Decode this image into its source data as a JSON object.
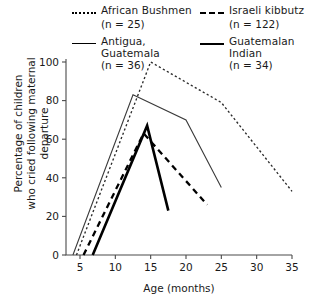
{
  "chart_data": {
    "type": "line",
    "title": "",
    "xlabel": "Age (months)",
    "ylabel": "Percentage of children\nwho cried following maternal departure",
    "xlim": [
      3,
      35
    ],
    "ylim": [
      0,
      100
    ],
    "xticks": [
      5,
      10,
      15,
      20,
      25,
      30,
      35
    ],
    "yticks": [
      0,
      20,
      40,
      60,
      80,
      100
    ],
    "grid": false,
    "legend_position": "top",
    "series": [
      {
        "name": "African Bushmen",
        "n_label": "(n = 25)",
        "n": 25,
        "style": "dotted",
        "x": [
          4.5,
          15,
          25,
          35
        ],
        "y": [
          0,
          100,
          79,
          33
        ]
      },
      {
        "name": "Antigua, Guatemala",
        "n_label": "(n = 36)",
        "n": 36,
        "style": "thin-solid",
        "x": [
          4.0,
          12.5,
          20,
          25
        ],
        "y": [
          0,
          83,
          70,
          35
        ]
      },
      {
        "name": "Israeli kibbutz",
        "n_label": "(n = 122)",
        "n": 122,
        "style": "dashed",
        "x": [
          5.5,
          14,
          23
        ],
        "y": [
          0,
          63,
          26
        ]
      },
      {
        "name": "Guatemalan Indian",
        "n_label": "(n = 34)",
        "n": 34,
        "style": "thick-solid",
        "x": [
          6.8,
          14.5,
          17.5
        ],
        "y": [
          0,
          67,
          23
        ]
      }
    ]
  },
  "legend": {
    "columns": [
      [
        {
          "label": "African Bushmen",
          "n_label": "(n = 25)",
          "style": "dotted"
        },
        {
          "label": "Antigua, Guatemala",
          "n_label": "(n = 36)",
          "style": "thin-solid"
        }
      ],
      [
        {
          "label": "Israeli kibbutz",
          "n_label": "(n = 122)",
          "style": "dashed"
        },
        {
          "label": "Guatemalan Indian",
          "n_label": "(n = 34)",
          "style": "thick-solid"
        }
      ]
    ]
  },
  "axes": {
    "ylabel_line1": "Percentage of children",
    "ylabel_line2": "who cried following maternal departure",
    "xlabel": "Age (months)"
  }
}
